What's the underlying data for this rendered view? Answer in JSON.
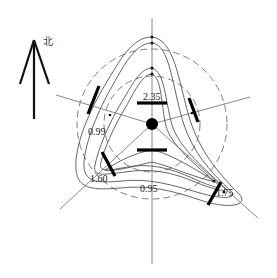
{
  "north_indicator": {
    "label": "北",
    "icon": "north-arrow-icon"
  },
  "labels": {
    "top": "2.35",
    "upper_left": "0.99",
    "lower_left": "1.60",
    "bottom": "0.95",
    "lower_right": "1.75"
  },
  "colors": {
    "line": "#555555",
    "marker": "#000000",
    "background": "#ffffff"
  }
}
